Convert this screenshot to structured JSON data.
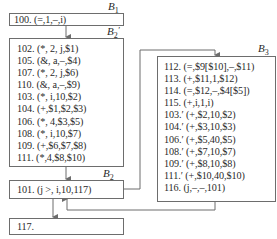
{
  "blocks": {
    "B1": {
      "label": "B",
      "sub": "1",
      "lines": [
        "100. (=,1,–,i)"
      ]
    },
    "B2p": {
      "label": "B",
      "sub": "2",
      "prime": "′",
      "lines": [
        "102. (*, 2, j,$1)",
        "105. (&, a,–,$4)",
        "107. (*, 2, j,$6)",
        "110. (&, a,–,$9)",
        "103. (*, i,10,$2)",
        "104. (+,$1,$2,$3)",
        "106. (*, 4,$3,$5)",
        "108. (*, i,10,$7)",
        "109. (+,$6,$7,$8)",
        "111. (*,4,$8,$10)"
      ]
    },
    "B2": {
      "label": "B",
      "sub": "2",
      "lines": [
        "101. (j >, i,10,117)"
      ]
    },
    "B117": {
      "lines": [
        "117."
      ]
    },
    "B3": {
      "label": "B",
      "sub": "3",
      "lines": [
        "112. (=,$9[$10],–,$11)",
        "113. (+,$11,1,$12)",
        "114. (=,$12,–,$4[$5])",
        "115. (+,i,1,i)",
        "103.′ (+,$2,10,$2)",
        "104.′ (+,$3,10,$3)",
        "106.′ (+,$5,40,$5)",
        "108.′ (+,$7,10,$7)",
        "109.′ (+,$8,10,$8)",
        "111.′ (+,$10,40,$10)",
        "116. (j,–,–,101)"
      ]
    }
  },
  "colors": {
    "stroke": "#6d6d6d",
    "text": "#2a2a2a"
  }
}
